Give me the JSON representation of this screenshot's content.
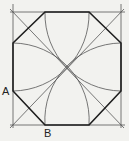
{
  "diagram": {
    "labels": {
      "a": "A",
      "b": "B"
    },
    "colors": {
      "background": "#f2f2ef",
      "thin_line": "#555555",
      "thick_line": "#1e1e1e",
      "text": "#222222"
    },
    "square": {
      "x1": 13,
      "y1": 12,
      "x2": 121,
      "y2": 125
    },
    "center": {
      "x": 67,
      "y": 69
    },
    "octagon_points": [
      [
        45,
        12
      ],
      [
        89,
        12
      ],
      [
        121,
        43
      ],
      [
        121,
        91
      ],
      [
        89,
        125
      ],
      [
        45,
        125
      ],
      [
        13,
        91
      ],
      [
        13,
        43
      ]
    ]
  }
}
